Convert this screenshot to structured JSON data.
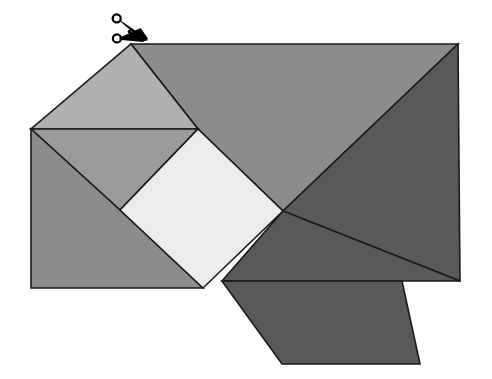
{
  "figure": {
    "background_color": "#ffffff",
    "outline_color": "#1a1a1a",
    "outline_width": 1.6,
    "canvas": {
      "width": 492,
      "height": 379
    },
    "palette": {
      "light_square": "#ececeb",
      "light_gray": "#b0b0b0",
      "mid_gray": "#9a9a9a",
      "medium_gray": "#8c8c8c",
      "dark_gray": "#595959",
      "darkest_gray": "#4d4d4d"
    },
    "pieces": [
      {
        "name": "upper-right-large-triangle",
        "fill": "#8c8c8c",
        "points": "131,44 458,44 283,211 198,129"
      },
      {
        "name": "right-dark-triangle",
        "fill": "#595959",
        "points": "458,44 460,281 283,211"
      },
      {
        "name": "upper-left-triangle",
        "fill": "#b0b0b0",
        "points": "131,44 198,129 31,129"
      },
      {
        "name": "mid-left-triangle",
        "fill": "#9a9a9a",
        "points": "31,129 198,129 120,210"
      },
      {
        "name": "lower-left-large-triangle",
        "fill": "#8c8c8c",
        "points": "31,129 120,210 203,288 31,288"
      },
      {
        "name": "center-light-square",
        "fill": "#ececeb",
        "points": "198,129 283,211 203,288 120,210"
      },
      {
        "name": "lower-right-dark-triangle",
        "fill": "#595959",
        "points": "283,211 460,281 222,281"
      },
      {
        "name": "bottom-parallelogram",
        "fill": "#595959",
        "points": "222,281 402,281 420,364 282,364"
      }
    ],
    "markers": [
      {
        "name": "cut-marker",
        "icon": "scissors-icon",
        "label": "Cut here",
        "x": 131,
        "y": 30,
        "color": "#000000"
      }
    ]
  }
}
